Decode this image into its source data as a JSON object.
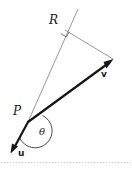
{
  "figure": {
    "type": "vector-projection-diagram",
    "background_color": "#ffffff",
    "labels": {
      "R": "R",
      "P": "P",
      "theta": "θ",
      "v": "v",
      "u": "u"
    },
    "colors": {
      "vector_stroke": "#161616",
      "thin_line_stroke": "#8c8c8c",
      "arc_stroke": "#3a3a3a",
      "right_angle_stroke": "#6e6e6e",
      "baseline_dots": "#c9c9c9",
      "text": "#1a1a1a"
    },
    "points": {
      "P": [
        28,
        122
      ],
      "R": [
        64,
        27
      ],
      "ray_end": [
        78,
        10
      ],
      "v_tip": [
        113,
        60
      ],
      "u_tip": [
        11,
        152
      ]
    },
    "geometry": {
      "right_angle_at": "R",
      "angle_theta_between": [
        "u",
        "v"
      ],
      "projection_segment": [
        "R",
        "v_tip"
      ]
    }
  }
}
